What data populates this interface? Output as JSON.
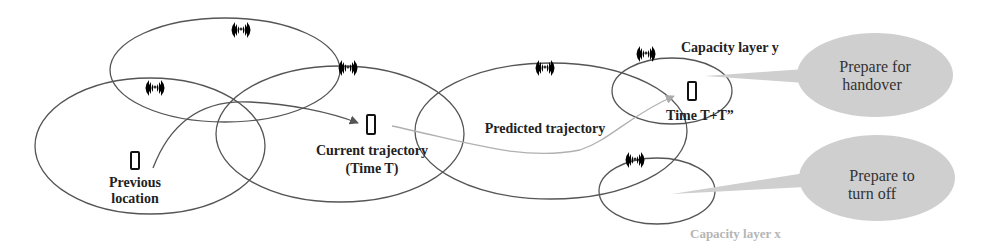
{
  "diagram": {
    "labels": {
      "previous_location_line1": "Previous",
      "previous_location_line2": "location",
      "current_trajectory_line1": "Current trajectory",
      "current_trajectory_line2": "(Time T)",
      "predicted_trajectory": "Predicted trajectory",
      "time_future": "Time T+T”",
      "capacity_layer_y": "Capacity layer y",
      "capacity_layer_x": "Capacity layer x"
    },
    "callouts": [
      {
        "line1": "Prepare for",
        "line2": "handover"
      },
      {
        "line1": "Prepare to",
        "line2": "turn off"
      }
    ],
    "icons": {
      "tower": "cell-tower-icon",
      "phone": "mobile-phone-icon"
    },
    "colors": {
      "cell_outline": "#555555",
      "callout_fill": "#cfcfcf",
      "past_trajectory": "#555555",
      "predicted_trajectory": "#b0b0b0",
      "faint_label": "#b5b5b5"
    }
  }
}
